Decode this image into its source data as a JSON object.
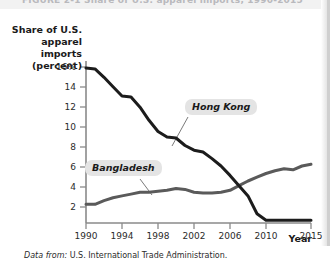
{
  "figure": {
    "cutoff_title": "FIGURE  2-1   Share of U.S. apparel imports, 1990-2015",
    "source_prefix": "Data from:",
    "source_text": "U.S. International Trade Administration."
  },
  "axes": {
    "y_title_line1": "Share of U.S.",
    "y_title_line2": "apparel imports",
    "y_title_line3": "(percent)",
    "x_title": "Year",
    "y_ticks": [
      "16%",
      "14",
      "12",
      "10",
      "8",
      "6",
      "4",
      "2"
    ],
    "y_tick_values": [
      16,
      14,
      12,
      10,
      8,
      6,
      4,
      2
    ],
    "x_ticks": [
      "1990",
      "1994",
      "1998",
      "2002",
      "2006",
      "2010",
      "2015"
    ],
    "x_tick_values": [
      1990,
      1994,
      1998,
      2002,
      2006,
      2010,
      2015
    ]
  },
  "annotations": {
    "hong_kong_label": "Hong Kong",
    "bangladesh_label": "Bangladesh"
  },
  "colors": {
    "hong_kong_line": "#1c1c1c",
    "bangladesh_line": "#5a5a5a",
    "axis": "#8a8a8a",
    "label_background": "#e4e4e4",
    "text": "#1a1a1a"
  },
  "chart_data": {
    "type": "line",
    "title": "Share of U.S. apparel imports",
    "xlabel": "Year",
    "ylabel": "Share of U.S. apparel imports (percent)",
    "xlim": [
      1990,
      2015
    ],
    "ylim": [
      0,
      17
    ],
    "grid": false,
    "legend": "inline-labels",
    "x": [
      1990,
      1991,
      1992,
      1993,
      1994,
      1995,
      1996,
      1997,
      1998,
      1999,
      2000,
      2001,
      2002,
      2003,
      2004,
      2005,
      2006,
      2007,
      2008,
      2009,
      2010,
      2011,
      2012,
      2013,
      2014,
      2015
    ],
    "series": [
      {
        "name": "Hong Kong",
        "color": "#1c1c1c",
        "values": [
          16.6,
          16.5,
          15.6,
          14.6,
          13.6,
          13.5,
          12.4,
          11.0,
          9.8,
          9.2,
          9.1,
          8.3,
          7.8,
          7.6,
          6.9,
          6.1,
          5.1,
          4.0,
          2.9,
          1.0,
          0.3,
          0.3,
          0.3,
          0.3,
          0.3,
          0.3
        ]
      },
      {
        "name": "Bangladesh",
        "color": "#5a5a5a",
        "values": [
          2.0,
          2.0,
          2.4,
          2.7,
          2.9,
          3.1,
          3.3,
          3.3,
          3.4,
          3.5,
          3.7,
          3.6,
          3.3,
          3.2,
          3.2,
          3.3,
          3.5,
          4.0,
          4.5,
          4.9,
          5.3,
          5.6,
          5.8,
          5.7,
          6.1,
          6.3
        ]
      }
    ],
    "crossover_year": 2007,
    "annotations": [
      {
        "text": "Hong Kong",
        "x": 2001,
        "y": 11.7
      },
      {
        "text": "Bangladesh",
        "x": 1995,
        "y": 6.0
      }
    ]
  }
}
